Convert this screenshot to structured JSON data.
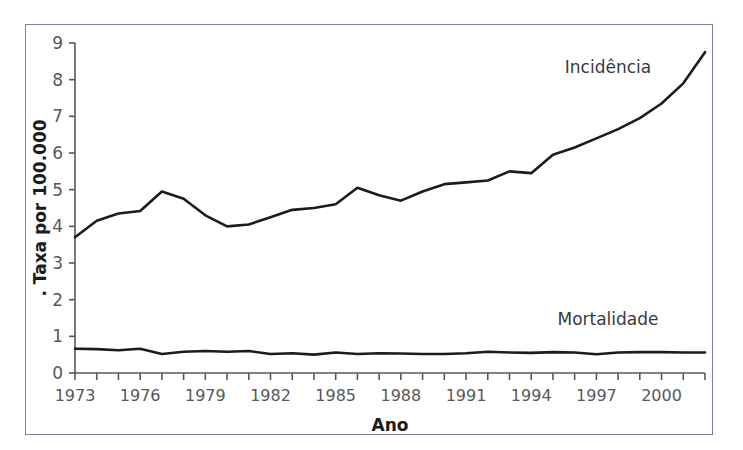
{
  "chart_data": {
    "type": "line",
    "title": "",
    "xlabel": "Ano",
    "ylabel": ". Taxa por 100.000",
    "xlim": [
      1973,
      2002
    ],
    "ylim": [
      0,
      9
    ],
    "grid": false,
    "legend_position": "inline-annotation",
    "y_ticks": [
      0,
      1,
      2,
      3,
      4,
      5,
      6,
      7,
      8,
      9
    ],
    "y_tick_labels": [
      "0",
      "1",
      "2",
      "3",
      "4",
      "5",
      "6",
      "7",
      "8",
      "9"
    ],
    "x_ticks": [
      1973,
      1974,
      1975,
      1976,
      1977,
      1978,
      1979,
      1980,
      1981,
      1982,
      1983,
      1984,
      1985,
      1986,
      1987,
      1988,
      1989,
      1990,
      1991,
      1992,
      1993,
      1994,
      1995,
      1996,
      1997,
      1998,
      1999,
      2000,
      2001,
      2002
    ],
    "x_tick_labels": [
      "1973",
      "1976",
      "1979",
      "1982",
      "1985",
      "1988",
      "1991",
      "1994",
      "1997",
      "2000"
    ],
    "x_labeled_ticks": [
      1973,
      1976,
      1979,
      1982,
      1985,
      1988,
      1991,
      1994,
      1997,
      2000
    ],
    "x": [
      1973,
      1974,
      1975,
      1976,
      1977,
      1978,
      1979,
      1980,
      1981,
      1982,
      1983,
      1984,
      1985,
      1986,
      1987,
      1988,
      1989,
      1990,
      1991,
      1992,
      1993,
      1994,
      1995,
      1996,
      1997,
      1998,
      1999,
      2000,
      2001,
      2002
    ],
    "series": [
      {
        "name": "Incidência",
        "color": "#1c1c1c",
        "annotation": "Incidência",
        "values": [
          3.7,
          4.15,
          4.35,
          4.42,
          4.95,
          4.75,
          4.3,
          4.0,
          4.05,
          4.25,
          4.45,
          4.5,
          4.6,
          5.05,
          4.85,
          4.7,
          4.95,
          5.15,
          5.2,
          5.25,
          5.5,
          5.45,
          5.95,
          6.15,
          6.4,
          6.65,
          6.95,
          7.35,
          7.9,
          8.75
        ]
      },
      {
        "name": "Mortalidade",
        "color": "#1c1c1c",
        "annotation": "Mortalidade",
        "values": [
          0.66,
          0.65,
          0.62,
          0.66,
          0.52,
          0.58,
          0.6,
          0.58,
          0.6,
          0.52,
          0.54,
          0.5,
          0.56,
          0.52,
          0.54,
          0.53,
          0.52,
          0.52,
          0.54,
          0.58,
          0.56,
          0.55,
          0.57,
          0.56,
          0.51,
          0.56,
          0.57,
          0.57,
          0.56,
          0.56
        ]
      }
    ]
  },
  "figure": {
    "border_color": "#7b7f9e",
    "background": "#ffffff",
    "axis_color": "#58585a"
  }
}
